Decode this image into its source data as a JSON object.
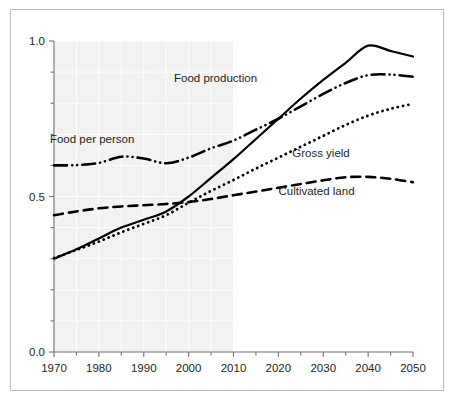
{
  "chart_data": {
    "type": "line",
    "title": "",
    "subtitle": "",
    "xlabel": "",
    "ylabel": "",
    "xlim": [
      1970,
      2050
    ],
    "ylim": [
      0.0,
      1.0
    ],
    "grid": true,
    "legend_position": "inline-annotations",
    "x_tick_labels": [
      "1970",
      "1980",
      "1990",
      "2000",
      "2010",
      "2020",
      "2030",
      "2040",
      "2050"
    ],
    "x_tick_values": [
      1970,
      1980,
      1990,
      2000,
      2010,
      2020,
      2030,
      2040,
      2050
    ],
    "x_minor_tick_values": [
      1975,
      1985,
      1995,
      2005,
      2015,
      2025,
      2035,
      2045
    ],
    "y_tick_labels": [
      "0.0",
      "0.5",
      "1.0"
    ],
    "y_tick_values": [
      0.0,
      0.5,
      1.0
    ],
    "y_minor_tick_values": [
      0.1,
      0.2,
      0.3,
      0.4,
      0.6,
      0.7,
      0.8,
      0.9
    ],
    "shaded_region": {
      "label": "historical",
      "x_start": 1970,
      "x_end": 2010,
      "color": "#f2f2f2"
    },
    "x": [
      1970,
      1975,
      1980,
      1985,
      1990,
      1995,
      2000,
      2005,
      2010,
      2015,
      2020,
      2025,
      2030,
      2035,
      2040,
      2045,
      2050
    ],
    "series": [
      {
        "name": "Food production",
        "line_style": "solid",
        "color": "#000000",
        "values": [
          0.3,
          0.33,
          0.365,
          0.4,
          0.425,
          0.452,
          0.5,
          0.56,
          0.62,
          0.685,
          0.75,
          0.815,
          0.875,
          0.93,
          0.985,
          0.968,
          0.95
        ]
      },
      {
        "name": "Food per person",
        "line_style": "dash-dot-dot",
        "color": "#000000",
        "values": [
          0.6,
          0.601,
          0.608,
          0.628,
          0.622,
          0.607,
          0.625,
          0.655,
          0.68,
          0.715,
          0.75,
          0.79,
          0.83,
          0.865,
          0.89,
          0.892,
          0.885
        ]
      },
      {
        "name": "Gross yield",
        "line_style": "dotted",
        "color": "#000000",
        "values": [
          0.302,
          0.328,
          0.355,
          0.385,
          0.412,
          0.44,
          0.48,
          0.518,
          0.553,
          0.59,
          0.625,
          0.66,
          0.695,
          0.73,
          0.76,
          0.782,
          0.798
        ]
      },
      {
        "name": "Cultivated land",
        "line_style": "dashed",
        "color": "#000000",
        "values": [
          0.44,
          0.452,
          0.462,
          0.468,
          0.472,
          0.476,
          0.482,
          0.492,
          0.504,
          0.516,
          0.528,
          0.54,
          0.552,
          0.562,
          0.563,
          0.557,
          0.546
        ]
      }
    ],
    "annotations": [
      {
        "text": "Food production",
        "x": 2006,
        "y": 0.868
      },
      {
        "text": "Food per person",
        "x": 1978.5,
        "y": 0.672
      },
      {
        "text": "Gross yield",
        "x": 2029.5,
        "y": 0.626
      },
      {
        "text": "Cultivated land",
        "x": 2028.5,
        "y": 0.505
      }
    ]
  },
  "axes": {
    "y_labels": [
      "1.0",
      "0.5",
      "0.0"
    ],
    "x_labels": [
      "1970",
      "1980",
      "1990",
      "2000",
      "2010",
      "2020",
      "2030",
      "2040",
      "2050"
    ]
  },
  "labels": {
    "food_production": "Food production",
    "food_per_person": "Food per person",
    "gross_yield": "Gross yield",
    "cultivated_land": "Cultivated land"
  },
  "colors": {
    "line": "#000000",
    "axis": "#6f7276",
    "frame": "#b9bcc0",
    "shade": "#f2f2f2",
    "grid": "#ffffff",
    "background": "#ffffff"
  }
}
